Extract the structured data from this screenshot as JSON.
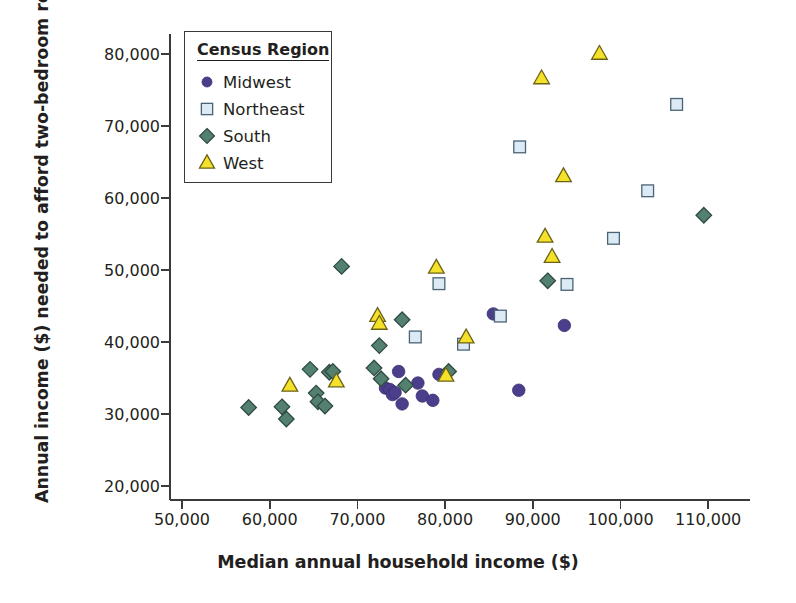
{
  "chart_data": {
    "type": "scatter",
    "title": "",
    "xlabel": "Median annual household income ($)",
    "ylabel": "Annual income ($) needed to afford two-bedroom rental",
    "xlim": [
      46000,
      114000
    ],
    "ylim": [
      17500,
      83500
    ],
    "xticks": [
      50000,
      60000,
      70000,
      80000,
      90000,
      100000,
      110000
    ],
    "xticklabels": [
      "50,000",
      "60,000",
      "70,000",
      "80,000",
      "90,000",
      "100,000",
      "110,000"
    ],
    "yticks": [
      20000,
      30000,
      40000,
      50000,
      60000,
      70000,
      80000
    ],
    "yticklabels": [
      "20,000",
      "30,000",
      "40,000",
      "50,000",
      "60,000",
      "70,000",
      "80,000"
    ],
    "grid": false,
    "legend": {
      "title": "Census Region",
      "position": "upper-left-inside",
      "entries": [
        {
          "name": "Midwest",
          "marker": "circle",
          "fill": "#4b3f8c",
          "edge": "#3b3170"
        },
        {
          "name": "Northeast",
          "marker": "square",
          "fill": "#dbeaf5",
          "edge": "#4a6375"
        },
        {
          "name": "South",
          "marker": "diamond",
          "fill": "#53806f",
          "edge": "#2f4c43"
        },
        {
          "name": "West",
          "marker": "triangle",
          "fill": "#f5e02a",
          "edge": "#6b6218"
        }
      ]
    },
    "series": [
      {
        "name": "Midwest",
        "marker": "circle",
        "fill": "#4b3f8c",
        "edge": "#3b3170",
        "points": [
          [
            73200,
            33600
          ],
          [
            73700,
            33400
          ],
          [
            74000,
            32700
          ],
          [
            74300,
            33000
          ],
          [
            74700,
            35900
          ],
          [
            75100,
            31400
          ],
          [
            76900,
            34300
          ],
          [
            77400,
            32500
          ],
          [
            78600,
            31900
          ],
          [
            79300,
            35500
          ],
          [
            85500,
            43900
          ],
          [
            88400,
            33300
          ],
          [
            93600,
            42300
          ]
        ]
      },
      {
        "name": "Northeast",
        "marker": "square",
        "fill": "#dbeaf5",
        "edge": "#4a6375",
        "points": [
          [
            76600,
            40700
          ],
          [
            79300,
            48100
          ],
          [
            82100,
            39700
          ],
          [
            86300,
            43600
          ],
          [
            88500,
            67100
          ],
          [
            93900,
            48000
          ],
          [
            99200,
            54400
          ],
          [
            103100,
            61000
          ],
          [
            106400,
            73000
          ]
        ]
      },
      {
        "name": "South",
        "marker": "diamond",
        "fill": "#53806f",
        "edge": "#2f4c43",
        "points": [
          [
            57600,
            30900
          ],
          [
            61400,
            31000
          ],
          [
            61900,
            29300
          ],
          [
            64600,
            36200
          ],
          [
            65300,
            32900
          ],
          [
            65500,
            31700
          ],
          [
            66300,
            31100
          ],
          [
            66800,
            35800
          ],
          [
            67200,
            35900
          ],
          [
            68200,
            50500
          ],
          [
            71900,
            36400
          ],
          [
            72500,
            39500
          ],
          [
            72700,
            34900
          ],
          [
            75100,
            43100
          ],
          [
            75500,
            34000
          ],
          [
            80400,
            35900
          ],
          [
            91700,
            48500
          ],
          [
            109500,
            57600
          ]
        ]
      },
      {
        "name": "West",
        "marker": "triangle",
        "fill": "#f5e02a",
        "edge": "#6b6218",
        "points": [
          [
            62300,
            33900
          ],
          [
            67600,
            34500
          ],
          [
            72300,
            43600
          ],
          [
            72500,
            42500
          ],
          [
            79000,
            50300
          ],
          [
            80100,
            35300
          ],
          [
            82400,
            40600
          ],
          [
            91000,
            76600
          ],
          [
            91400,
            54600
          ],
          [
            92200,
            51800
          ],
          [
            93500,
            63000
          ],
          [
            97600,
            80000
          ]
        ]
      }
    ]
  }
}
